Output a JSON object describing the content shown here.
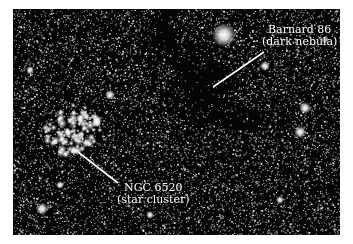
{
  "image": {
    "description": "Astronomical photograph of a dense star field with a dark nebula and an open star cluster",
    "background_color": "#050505",
    "frame_color": "#ffffff"
  },
  "labels": [
    {
      "name": "barnard-86-label",
      "line1": "Barnard 86",
      "line2": "(dark nebula)",
      "pointer": {
        "x1": 213,
        "y1": 87,
        "x2": 264,
        "y2": 52
      }
    },
    {
      "name": "ngc-6520-label",
      "line1": "NGC 6520",
      "line2": "(star cluster)",
      "pointer": {
        "x1": 78,
        "y1": 152,
        "x2": 118,
        "y2": 183
      }
    }
  ],
  "features": {
    "bright_star": {
      "x": 224,
      "y": 35,
      "r": 5
    },
    "star_cluster_center": {
      "x": 72,
      "y": 130
    },
    "dark_nebula_center": {
      "x": 205,
      "y": 110
    }
  }
}
